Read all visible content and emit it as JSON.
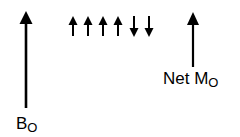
{
  "diagram": {
    "labels": {
      "b0": {
        "main": "B",
        "sub": "O"
      },
      "net_m0": {
        "main": "Net M",
        "sub": "O"
      }
    },
    "field_arrow": {
      "direction": "up",
      "name": "B0"
    },
    "spins": [
      "up",
      "up",
      "up",
      "up",
      "down",
      "down"
    ],
    "net_arrow": {
      "direction": "up",
      "name": "Net M0"
    },
    "colors": {
      "arrow": "#000000",
      "background": "#ffffff"
    }
  }
}
